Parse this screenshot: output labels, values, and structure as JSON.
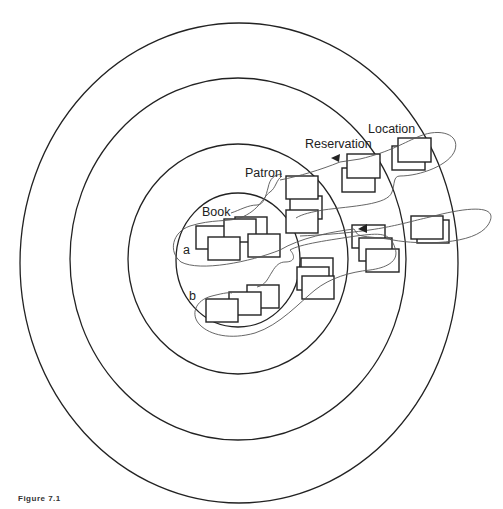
{
  "figure": {
    "caption": "Figure 7.1",
    "type": "concentric-entity-diagram"
  },
  "rings": [
    {
      "name": "Book",
      "label": "Book",
      "cx": 238,
      "cy": 260,
      "rx": 62,
      "ry": 67
    },
    {
      "name": "Patron",
      "label": "Patron",
      "cx": 238,
      "cy": 259,
      "rx": 110,
      "ry": 115
    },
    {
      "name": "Reservation",
      "label": "Reservation",
      "cx": 238,
      "cy": 259,
      "rx": 168,
      "ry": 181
    },
    {
      "name": "Location",
      "label": "Location",
      "cx": 239,
      "cy": 263,
      "rx": 219,
      "ry": 240
    }
  ],
  "labels": {
    "book": "Book",
    "patron": "Patron",
    "reservation": "Reservation",
    "location": "Location",
    "path_a": "a",
    "path_b": "b"
  },
  "paths": [
    {
      "name": "a",
      "description": "Loop from Book through Patron, Reservation to Location"
    },
    {
      "name": "b",
      "description": "Loop from Book through Patron, Reservation to Location (second path)"
    }
  ],
  "colors": {
    "stroke": "#222222",
    "path": "#555555",
    "background": "#ffffff"
  }
}
